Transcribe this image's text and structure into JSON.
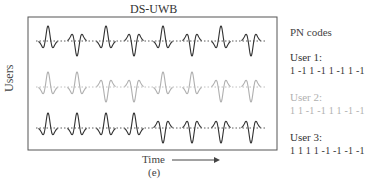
{
  "title": "DS-UWB",
  "y_axis_label": "Users",
  "x_axis_label": "Time",
  "sub_label": "(e)",
  "legend": {
    "heading": "PN codes",
    "users": [
      {
        "name": "User 1:",
        "code_text": "1 -1 1 -1 1 -1 1 -1",
        "code": [
          1,
          -1,
          1,
          -1,
          1,
          -1,
          1,
          -1
        ],
        "color": "#333333"
      },
      {
        "name": "User 2:",
        "code_text": "1 1 -1 -1 1 1 -1 -1",
        "code": [
          1,
          1,
          -1,
          -1,
          1,
          1,
          -1,
          -1
        ],
        "color": "#b0b0b0"
      },
      {
        "name": "User 3:",
        "code_text": "1 1 1 1 -1 -1 -1 -1",
        "code": [
          1,
          1,
          1,
          1,
          -1,
          -1,
          -1,
          -1
        ],
        "color": "#333333"
      }
    ]
  },
  "layout": {
    "frame": {
      "x": 28,
      "y": 17,
      "w": 249,
      "h": 133
    },
    "pulse_x": [
      48,
      77,
      106,
      134,
      163,
      192,
      221,
      251
    ],
    "baselines_y": [
      41,
      87,
      128
    ]
  }
}
